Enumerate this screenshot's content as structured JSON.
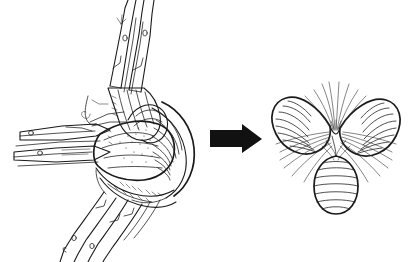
{
  "figure": {
    "background_color": "#ffffff",
    "ink_color": "#1a1a1a",
    "arrow_color": "#111111",
    "width": 413,
    "height": 262,
    "has_text_labels": false,
    "has_border": false,
    "style": "pen-and-ink line drawing"
  },
  "panels": [
    {
      "id": "left-panel",
      "name": "lateral-view-drawing",
      "caption": "",
      "description": "Detailed pen-and-ink lateral view of an orchid-like flower with upright slender stalks, horizontal bracts at left, hatched fleshy lip and column at centre, and descending stems at lower left",
      "parts": [
        {
          "name": "upper-stalks",
          "description": "Pair of slender upright stalks rising to top edge, each bearing a small circular marking"
        },
        {
          "name": "left-bracts",
          "description": "Horizontal elongated bracts projecting to the left, each with a small circle"
        },
        {
          "name": "central-mass",
          "description": "Hatched and stippled fleshy central body (lip and column)"
        },
        {
          "name": "ribbed-flank",
          "description": "Strongly ribbed curved flank on the right side of the central mass"
        },
        {
          "name": "lower-stems",
          "description": "Two slender stems sweeping down to the bottom left, each with a small circle"
        },
        {
          "name": "thread-appendage",
          "description": "Fine curling thread-like appendage at mid left"
        }
      ]
    },
    {
      "id": "center-arrow",
      "name": "transformation-arrow",
      "direction": "right",
      "color": "#111111",
      "description": "Solid black right-pointing block arrow indicating the change of viewpoint"
    },
    {
      "id": "right-panel",
      "name": "frontal-view-drawing",
      "caption": "",
      "description": "Stylised frontal view of the same flower showing three ribbed lobes radiating from a central point with fine hair-like lines",
      "lobes": [
        {
          "name": "upper-left-lobe",
          "orientation": "upper-left",
          "fill": "horizontal ribbing"
        },
        {
          "name": "upper-right-lobe",
          "orientation": "upper-right",
          "fill": "horizontal ribbing"
        },
        {
          "name": "lower-pendant-lobe",
          "orientation": "bottom-centre",
          "shape": "egg-shaped",
          "fill": "horizontal ribbing"
        }
      ],
      "center": {
        "name": "radiating-centre",
        "description": "Convergence point from which fine hair-like lines radiate outward in all directions"
      }
    }
  ]
}
